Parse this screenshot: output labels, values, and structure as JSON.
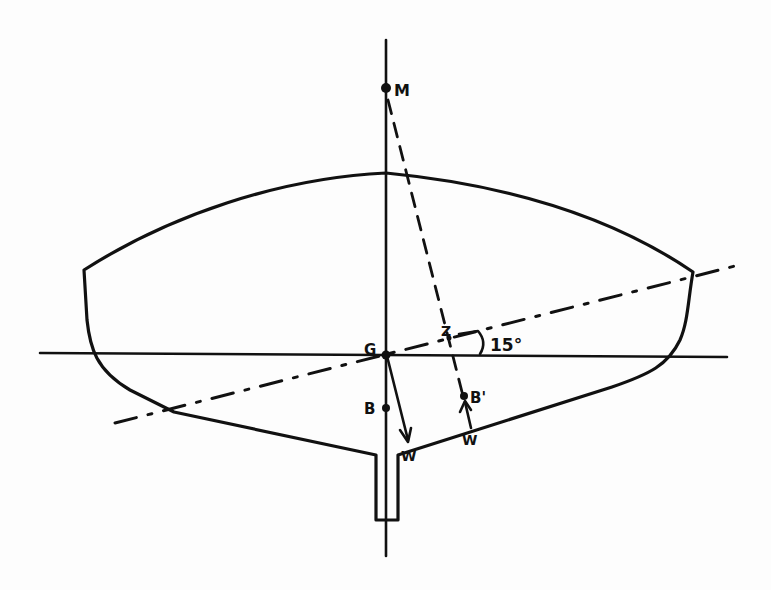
{
  "diagram": {
    "title": "",
    "points": {
      "M": {
        "label": "M",
        "x": 386,
        "y": 88
      },
      "G": {
        "label": "G",
        "x": 386,
        "y": 355
      },
      "Z": {
        "label": "Z",
        "x": 449,
        "y": 337
      },
      "B": {
        "label": "B",
        "x": 386,
        "y": 408
      },
      "B_prime": {
        "label": "B'",
        "x": 464,
        "y": 396
      }
    },
    "forces": {
      "weight_label": "W",
      "buoyancy_label": "W"
    },
    "angle": {
      "label": "15°",
      "value_deg": 15
    },
    "lines": {
      "centerline": "vertical solid",
      "waterline_upright": "horizontal solid",
      "waterline_heeled": "dash-dot at 15°",
      "metacentric_line": "dashed M to B'"
    },
    "colors": {
      "ink": "#111111",
      "paper": "#fdfdfd"
    }
  }
}
